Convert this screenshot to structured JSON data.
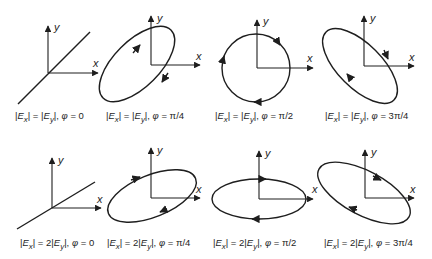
{
  "figure": {
    "axis_labels": {
      "x": "x",
      "y": "y"
    },
    "rows": [
      {
        "amplitude_relation": "|Ex| = |Ey|",
        "panels": [
          {
            "id": "r1c1",
            "shape": "line",
            "caption": "|Ex| = |Ey|, φ = 0",
            "phi": "0"
          },
          {
            "id": "r1c2",
            "shape": "ellipse",
            "caption": "|Ex| = |Ey|, φ = π/4",
            "phi": "π/4"
          },
          {
            "id": "r1c3",
            "shape": "circle",
            "caption": "|Ex| = |Ey|, φ = π/2",
            "phi": "π/2"
          },
          {
            "id": "r1c4",
            "shape": "ellipse",
            "caption": "|Ex| = |Ey|, φ = 3π/4",
            "phi": "3π/4"
          }
        ]
      },
      {
        "amplitude_relation": "|Ex| = 2|Ey|",
        "panels": [
          {
            "id": "r2c1",
            "shape": "line",
            "caption": "|Ex| = 2|Ey|, φ = 0",
            "phi": "0"
          },
          {
            "id": "r2c2",
            "shape": "ellipse",
            "caption": "|Ex| = 2|Ey|, φ = π/4",
            "phi": "π/4"
          },
          {
            "id": "r2c3",
            "shape": "ellipse",
            "caption": "|Ex| = 2|Ey|, φ = π/2",
            "phi": "π/2"
          },
          {
            "id": "r2c4",
            "shape": "ellipse",
            "caption": "|Ex| = 2|Ey|, φ = 3π/4",
            "phi": "3π/4"
          }
        ]
      }
    ],
    "caption_parts": {
      "E": "E",
      "sub_x": "x",
      "sub_y": "y",
      "eq": " = ",
      "two": "2",
      "phi_sep": ", ",
      "phi": "φ",
      "phi_eq": " = ",
      "r1": [
        "0",
        "π/4",
        "π/2",
        "3π/4"
      ],
      "r2": [
        "0",
        "π/4",
        "π/2",
        "3π/4"
      ]
    },
    "colors": {
      "ink": "#1e1e1e",
      "background": "#ffffff"
    }
  }
}
